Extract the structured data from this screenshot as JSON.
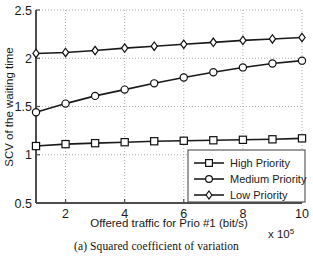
{
  "figure": {
    "caption": "(a) Squared coefficient of variation"
  },
  "chart_data": {
    "type": "line",
    "title": "",
    "xlabel": "Offered traffic for Prio #1 (bit/s)",
    "ylabel": "SCV of the waiting time",
    "x_exponent_label": "x 10",
    "x_exponent_power": "5",
    "xlim": [
      1,
      10
    ],
    "ylim": [
      0.5,
      2.5
    ],
    "xticks": [
      2,
      4,
      6,
      8,
      10
    ],
    "xticklabels": [
      "2",
      "4",
      "6",
      "8",
      "10"
    ],
    "yticks": [
      0.5,
      1,
      1.5,
      2,
      2.5
    ],
    "yticklabels": [
      "0.5",
      "1",
      "1.5",
      "2",
      "2.5"
    ],
    "grid": true,
    "grid_style": "dotted",
    "legend_position": "lower right",
    "x": [
      1,
      2,
      3,
      4,
      5,
      6,
      7,
      8,
      9,
      10
    ],
    "series": [
      {
        "name": "High Priority",
        "marker": "square",
        "color": "#1a1a1a",
        "values": [
          1.09,
          1.11,
          1.12,
          1.13,
          1.14,
          1.145,
          1.15,
          1.155,
          1.16,
          1.17
        ]
      },
      {
        "name": "Medium Priority",
        "marker": "circle",
        "color": "#1a1a1a",
        "values": [
          1.44,
          1.53,
          1.61,
          1.675,
          1.74,
          1.8,
          1.855,
          1.905,
          1.945,
          1.975
        ]
      },
      {
        "name": "Low Priority",
        "marker": "diamond",
        "color": "#1a1a1a",
        "values": [
          2.05,
          2.06,
          2.08,
          2.105,
          2.125,
          2.145,
          2.165,
          2.185,
          2.2,
          2.215
        ]
      }
    ]
  },
  "legend": {
    "items": [
      {
        "label": "High Priority",
        "marker": "square"
      },
      {
        "label": "Medium Priority",
        "marker": "circle"
      },
      {
        "label": "Low Priority",
        "marker": "diamond"
      }
    ]
  }
}
